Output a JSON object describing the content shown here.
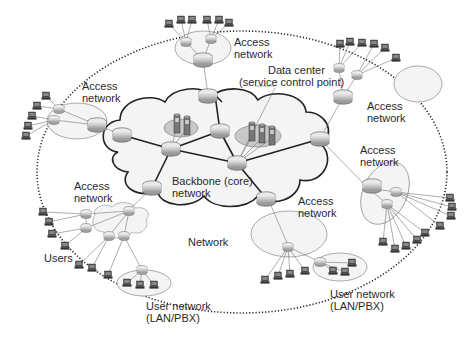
{
  "diagram": {
    "type": "network-topology",
    "colors": {
      "background": "#ffffff",
      "line": "#333333",
      "thin_line": "#777777",
      "cloud_fill": "#f4f4f4",
      "access_fill": "#f2f2f2",
      "datacenter_fill": "#c8c8c8",
      "router_fill": "#d6d6d6",
      "boundary": "#222222"
    },
    "labels": {
      "access_top": [
        "Access",
        "network"
      ],
      "access_left": [
        "Access",
        "network"
      ],
      "access_right_top": [
        "Access",
        "network"
      ],
      "access_right_mid": [
        "Access",
        "network"
      ],
      "access_lower_left": [
        "Access",
        "network"
      ],
      "access_lower_center": [
        "Access",
        "network"
      ],
      "data_center": [
        "Data center",
        "(service control point)"
      ],
      "backbone": [
        "Backbone (core)",
        "network"
      ],
      "network": "Network",
      "users": "Users",
      "user_network_left": [
        "User network",
        "(LAN/PBX)"
      ],
      "user_network_right": [
        "User network",
        "(LAN/PBX)"
      ]
    },
    "nodes": [
      {
        "id": "backbone",
        "label": "Backbone (core) network",
        "kind": "cloud"
      },
      {
        "id": "datacenter-1",
        "label": "Data center",
        "kind": "server-group"
      },
      {
        "id": "datacenter-2",
        "label": "Data center (service control point)",
        "kind": "server-group"
      },
      {
        "id": "access-top",
        "label": "Access network",
        "kind": "access-ellipse"
      },
      {
        "id": "access-left",
        "label": "Access network",
        "kind": "access-ellipse"
      },
      {
        "id": "access-right-top",
        "label": "Access network",
        "kind": "access-ellipse"
      },
      {
        "id": "access-right-mid",
        "label": "Access network",
        "kind": "access-ellipse"
      },
      {
        "id": "access-lower-left",
        "label": "Access network",
        "kind": "access-cloud"
      },
      {
        "id": "access-lower-center",
        "label": "Access network",
        "kind": "access-ellipse"
      },
      {
        "id": "user-net-left",
        "label": "User network (LAN/PBX)",
        "kind": "lan-ellipse"
      },
      {
        "id": "user-net-right",
        "label": "User network (LAN/PBX)",
        "kind": "lan-ellipse"
      },
      {
        "id": "users",
        "label": "Users",
        "kind": "terminal-group"
      }
    ],
    "boundary": {
      "label": "Network",
      "style": "dotted-ellipse"
    }
  }
}
